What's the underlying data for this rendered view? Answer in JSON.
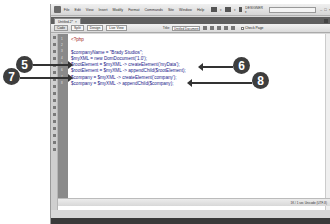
{
  "window": {
    "menu": [
      "File",
      "Edit",
      "View",
      "Insert",
      "Modify",
      "Format",
      "Commands",
      "Site",
      "Window",
      "Help"
    ],
    "workspace": "DESIGNER ▾",
    "controls": [
      "–",
      "□",
      "×"
    ]
  },
  "tabs": [
    {
      "label": "Untitled-2*",
      "close": "×"
    }
  ],
  "toolbar": {
    "code_label": "Code",
    "split_label": "Split",
    "design_label": "Design",
    "live_view_label": "Live View",
    "title_label": "Title:",
    "title_value": "Untitled Document",
    "check_page_label": "Check Page"
  },
  "editor": {
    "line_numbers": [
      "1",
      "2",
      "3",
      "4",
      "5",
      "6",
      "7",
      "8"
    ],
    "lines": [
      "<?php",
      "",
      "$companyName = \"Brady Studios\";",
      "$myXML = new DomDocument('1.0');",
      "$rootElement = $myXML -> createElement('myData');",
      "$rootElement = $myXML -> appendChild($rootElement);",
      "$company = $myXML -> createElement('company');",
      "$company = $myXML -> appendChild($company);"
    ]
  },
  "status": {
    "text": "1K / 1 sec  Unicode (UTF-8)"
  },
  "callouts": [
    {
      "number": "5",
      "points_to_line": 5,
      "side": "left"
    },
    {
      "number": "6",
      "points_to_line": 6,
      "side": "right"
    },
    {
      "number": "7",
      "points_to_line": 7,
      "side": "left"
    },
    {
      "number": "8",
      "points_to_line": 8,
      "side": "right"
    }
  ],
  "colors": {
    "callout_bg": "#3d3d3d",
    "code_text": "#1a1a8a",
    "gutter": "#8a8a8a"
  }
}
